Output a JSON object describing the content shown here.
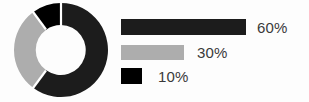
{
  "chart_data": {
    "type": "pie",
    "variant": "donut",
    "title": "",
    "legend_position": "right",
    "start_angle_deg": 0,
    "direction": "clockwise",
    "categories": [
      "60%",
      "30%",
      "10%"
    ],
    "values": [
      60,
      30,
      10
    ],
    "labels": [
      "60%",
      "30%",
      "10%"
    ],
    "colors": [
      "#1c1c1c",
      "#adadad",
      "#000000"
    ],
    "slices": [
      {
        "label": "60%",
        "value": 60,
        "color": "#1c1c1c",
        "start_deg": 0,
        "end_deg": 216
      },
      {
        "label": "30%",
        "value": 30,
        "color": "#adadad",
        "start_deg": 216,
        "end_deg": 324
      },
      {
        "label": "10%",
        "value": 10,
        "color": "#000000",
        "start_deg": 324,
        "end_deg": 360
      }
    ]
  },
  "donut": {
    "center_x": 48,
    "center_y": 48,
    "outer_radius": 47,
    "inner_radius": 22,
    "gap_color": "#ffffff"
  },
  "legend": {
    "rows": [
      {
        "label": "60%",
        "color": "#1c1c1c",
        "bar_width": 125
      },
      {
        "label": "30%",
        "color": "#adadad",
        "bar_width": 63
      },
      {
        "label": "10%",
        "color": "#000000",
        "bar_width": 21
      }
    ]
  },
  "colors": {
    "background": "#fdfdfd",
    "dark": "#1c1c1c",
    "gray": "#adadad",
    "black": "#000000",
    "text": "#3a3a3a"
  }
}
